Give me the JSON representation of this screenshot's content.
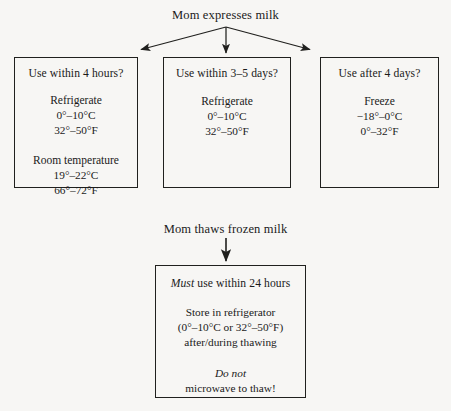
{
  "page": {
    "background_color": "#f7f6f4",
    "ink_color": "#1a1a1a"
  },
  "diagram": {
    "type": "flowchart",
    "top_heading": "Mom expresses milk",
    "mid_heading": "Mom thaws frozen milk",
    "branches": [
      {
        "id": "within-4-hours",
        "title": "Use within 4 hours?",
        "groups": [
          {
            "label": "Refrigerate",
            "lines": [
              "0°–10°C",
              "32°–50°F"
            ]
          },
          {
            "label": "Room temperature",
            "lines": [
              "19°–22°C",
              "66°–72°F"
            ]
          }
        ]
      },
      {
        "id": "within-3-5-days",
        "title": "Use within 3–5 days?",
        "groups": [
          {
            "label": "Refrigerate",
            "lines": [
              "0°–10°C",
              "32°–50°F"
            ]
          }
        ]
      },
      {
        "id": "after-4-days",
        "title": "Use after 4 days?",
        "groups": [
          {
            "label": "Freeze",
            "lines": [
              "−18°–0°C",
              "0°–32°F"
            ]
          }
        ]
      }
    ],
    "thaw_box": {
      "id": "thaw-instructions",
      "title_emphasis": "Must",
      "title_rest": " use within 24 hours",
      "groups": [
        {
          "lines": [
            "Store in refrigerator",
            "(0°–10°C or 32°–50°F)",
            "after/during thawing"
          ]
        },
        {
          "emphasis": "Do not",
          "lines": [
            "microwave to thaw!"
          ]
        }
      ]
    },
    "arrows": [
      {
        "name": "arrow-to-left-box",
        "from": [
          226,
          27
        ],
        "to": [
          139,
          50
        ]
      },
      {
        "name": "arrow-to-middle-box",
        "from": [
          226,
          27
        ],
        "to": [
          226,
          54
        ]
      },
      {
        "name": "arrow-to-right-box",
        "from": [
          226,
          27
        ],
        "to": [
          312,
          50
        ]
      },
      {
        "name": "arrow-to-thaw-box",
        "from": [
          226,
          238
        ],
        "to": [
          226,
          262
        ]
      }
    ]
  }
}
